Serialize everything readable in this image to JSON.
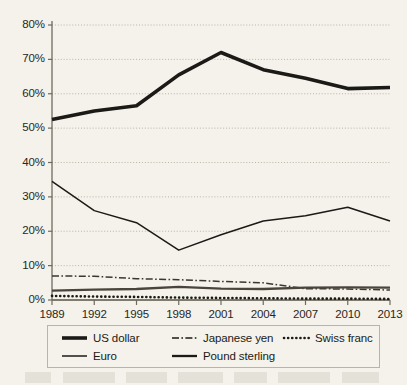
{
  "chart_data": {
    "type": "line",
    "title": "",
    "xlabel": "",
    "ylabel": "",
    "x": [
      1989,
      1992,
      1995,
      1998,
      2001,
      2004,
      2007,
      2010,
      2013
    ],
    "categories": [
      "1989",
      "1992",
      "1995",
      "1998",
      "2001",
      "2004",
      "2007",
      "2010",
      "2013"
    ],
    "ylim": [
      0,
      80
    ],
    "ytick_values": [
      0,
      10,
      20,
      30,
      40,
      50,
      60,
      70,
      80
    ],
    "ytick_labels": [
      "0%",
      "10%",
      "20%",
      "30%",
      "40%",
      "50%",
      "60%",
      "70%",
      "80%"
    ],
    "grid": true,
    "grid_style": "dotted-horizontal",
    "legend_position": "bottom",
    "series": [
      {
        "name": "US dollar",
        "style": "solid-thick",
        "color": "#1c1a17",
        "values": [
          52.5,
          55.0,
          56.5,
          65.5,
          72.0,
          67.0,
          64.5,
          61.5,
          61.8
        ]
      },
      {
        "name": "Euro",
        "style": "solid-thin",
        "color": "#1c1a17",
        "values": [
          34.5,
          26.0,
          22.5,
          14.5,
          19.0,
          23.0,
          24.5,
          27.0,
          23.0
        ]
      },
      {
        "name": "Japanese yen",
        "style": "dash-dot",
        "color": "#3b3630",
        "values": [
          7.0,
          6.9,
          6.2,
          5.9,
          5.4,
          5.0,
          3.3,
          3.2,
          2.9
        ]
      },
      {
        "name": "Pound sterling",
        "style": "solid-medium",
        "color": "#4a443c",
        "values": [
          2.7,
          3.0,
          3.2,
          3.8,
          3.3,
          3.2,
          3.6,
          3.7,
          3.6
        ]
      },
      {
        "name": "Swiss franc",
        "style": "dotted",
        "color": "#1c1a17",
        "values": [
          1.2,
          1.0,
          0.9,
          0.7,
          0.6,
          0.5,
          0.4,
          0.4,
          0.3
        ]
      }
    ]
  },
  "axis": {
    "y_ticks": [
      {
        "label": "80%"
      },
      {
        "label": "70%"
      },
      {
        "label": "60%"
      },
      {
        "label": "50%"
      },
      {
        "label": "40%"
      },
      {
        "label": "30%"
      },
      {
        "label": "20%"
      },
      {
        "label": "10%"
      },
      {
        "label": "0%"
      }
    ],
    "x_ticks": [
      {
        "label": "1989"
      },
      {
        "label": "1992"
      },
      {
        "label": "1995"
      },
      {
        "label": "1998"
      },
      {
        "label": "2001"
      },
      {
        "label": "2004"
      },
      {
        "label": "2007"
      },
      {
        "label": "2010"
      },
      {
        "label": "2013"
      }
    ]
  },
  "legend": {
    "entries": [
      {
        "label": "US dollar",
        "style": "solid-thick"
      },
      {
        "label": "Euro",
        "style": "solid-thin"
      },
      {
        "label": "Japanese yen",
        "style": "dash-dot"
      },
      {
        "label": "Pound sterling",
        "style": "solid-medium"
      },
      {
        "label": "Swiss franc",
        "style": "dotted"
      }
    ]
  },
  "colors": {
    "background": "#f4f2ea",
    "ink": "#1c1a17",
    "grid": "#b3aea0",
    "axis": "#6f6a5e",
    "legend_border": "#b9b4a6"
  }
}
